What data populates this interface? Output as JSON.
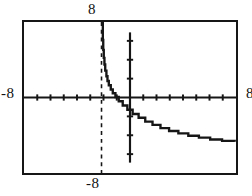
{
  "figure": {
    "kind": "graphing-calculator-plot",
    "background_color": "#ffffff",
    "ink_color": "#161616"
  },
  "axis_labels": {
    "top": "8",
    "left": "-8",
    "right": "8",
    "bottom": "-8"
  },
  "chart_data": {
    "type": "line",
    "title": "",
    "xlabel": "",
    "ylabel": "",
    "xlim": [
      -8,
      8
    ],
    "ylim": [
      -8,
      8
    ],
    "grid": false,
    "legend": null,
    "legend_position": "none",
    "x_tick_values": [
      -7,
      -6,
      -5,
      -4,
      -3,
      -2,
      -1,
      1,
      2,
      3,
      4,
      5,
      6,
      7
    ],
    "y_tick_values": [
      -6,
      -4,
      -2,
      2,
      4,
      6
    ],
    "annotations": [
      {
        "name": "vertical-asymptote",
        "style": "dashed",
        "x": -2.15,
        "label": ""
      }
    ],
    "series": [
      {
        "name": "curve",
        "style": "solid-stepped",
        "x": [
          -2.05,
          -2.02,
          -1.98,
          -1.93,
          -1.87,
          -1.78,
          -1.7,
          -1.6,
          -1.45,
          -1.3,
          -1.1,
          -0.85,
          -0.55,
          -0.2,
          0.2,
          0.65,
          1.15,
          1.7,
          2.3,
          2.95,
          3.65,
          4.4,
          5.2,
          6.05,
          6.95,
          7.9
        ],
        "y": [
          6.1,
          5.05,
          4.2,
          3.5,
          2.85,
          2.25,
          1.75,
          1.3,
          0.85,
          0.45,
          0.05,
          -0.4,
          -0.85,
          -1.3,
          -1.75,
          -2.15,
          -2.55,
          -2.9,
          -3.25,
          -3.55,
          -3.8,
          -4.05,
          -4.25,
          -4.45,
          -4.6,
          -4.7
        ]
      }
    ]
  }
}
